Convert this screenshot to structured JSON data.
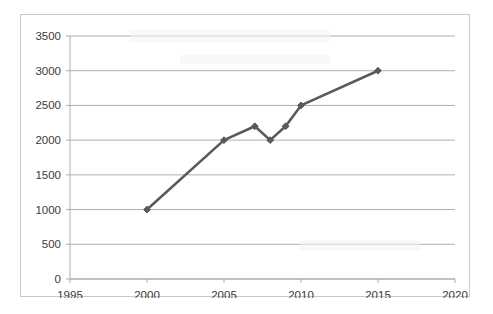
{
  "chart_data": {
    "type": "line",
    "title": "",
    "subtitle": "",
    "xlabel": "",
    "ylabel": "",
    "xlim": [
      1995,
      2020
    ],
    "ylim": [
      0,
      3500
    ],
    "grid": true,
    "legend": false,
    "legend_position": "none",
    "x_ticks": [
      1995,
      2000,
      2005,
      2010,
      2015,
      2020
    ],
    "x_tick_labels": [
      "1995",
      "2000",
      "2005",
      "2010",
      "2015",
      "2020"
    ],
    "y_ticks": [
      0,
      500,
      1000,
      1500,
      2000,
      2500,
      3000,
      3500
    ],
    "y_tick_labels": [
      "0",
      "500",
      "1000",
      "1500",
      "2000",
      "2500",
      "3000",
      "3500"
    ],
    "series": [
      {
        "name": "series-1",
        "color": "#5a5a5a",
        "marker": "diamond",
        "x": [
          2000,
          2005,
          2007,
          2008,
          2009,
          2010,
          2015
        ],
        "values": [
          1000,
          2000,
          2200,
          2000,
          2200,
          2500,
          3000
        ],
        "points": [
          {
            "x": 2000,
            "y": 1000
          },
          {
            "x": 2005,
            "y": 2000
          },
          {
            "x": 2007,
            "y": 2200
          },
          {
            "x": 2008,
            "y": 2000
          },
          {
            "x": 2009,
            "y": 2200
          },
          {
            "x": 2010,
            "y": 2500
          },
          {
            "x": 2015,
            "y": 3000
          }
        ]
      }
    ],
    "colors": {
      "line": "#5a5a5a",
      "marker": "#595959",
      "gridline": "#a6a6a6",
      "axis": "#a6a6a6",
      "tick_text": "#3a3a3a",
      "plot_background": "#ffffff",
      "frame_border": "#c8c8c8"
    }
  }
}
